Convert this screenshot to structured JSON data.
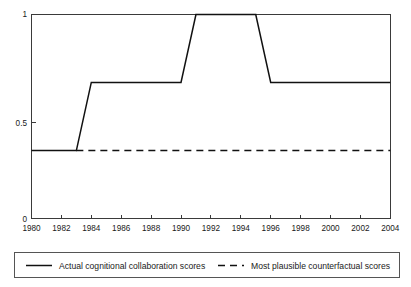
{
  "chart_data": {
    "type": "line",
    "title": "",
    "subtitle": "",
    "xlabel": "",
    "ylabel": "",
    "xlim": [
      1980,
      2004
    ],
    "ylim": [
      0,
      1
    ],
    "grid": false,
    "legend_position": "bottom",
    "x_ticks": [
      1980,
      1982,
      1984,
      1986,
      1988,
      1990,
      1992,
      1994,
      1996,
      1998,
      2000,
      2002,
      2004
    ],
    "x_tick_labels": [
      "1980",
      "1982",
      "1984",
      "1986",
      "1988",
      "1990",
      "1992",
      "1994",
      "1996",
      "1998",
      "2000",
      "2002",
      "2004"
    ],
    "y_ticks": [
      0,
      0.5,
      1
    ],
    "y_tick_labels": [
      "0",
      "0.5",
      "1"
    ],
    "series": [
      {
        "name": "Actual cognitional collaboration scores",
        "style": "solid",
        "color": "#111111",
        "x": [
          1980,
          1983,
          1984,
          1990,
          1991,
          1995,
          1996,
          2004
        ],
        "values": [
          0.333,
          0.333,
          0.667,
          0.667,
          1.0,
          1.0,
          0.667,
          0.667
        ]
      },
      {
        "name": "Most plausible counterfactual scores",
        "style": "dashed",
        "color": "#111111",
        "x": [
          1983,
          2004
        ],
        "values": [
          0.333,
          0.333
        ]
      }
    ],
    "legend": [
      {
        "label": "Actual cognitional collaboration scores",
        "style": "solid"
      },
      {
        "label": "Most plausible counterfactual scores",
        "style": "dashed"
      }
    ]
  },
  "axis": {
    "y_label_top": "1",
    "y_label_mid": "0.5",
    "y_label_bottom": "0",
    "x_labels": [
      "1980",
      "1982",
      "1984",
      "1986",
      "1988",
      "1990",
      "1992",
      "1994",
      "1996",
      "1998",
      "2000",
      "2002",
      "2004"
    ]
  },
  "legend": {
    "entry_1": "Actual cognitional collaboration scores",
    "entry_2": "Most plausible counterfactual scores"
  },
  "colors": {
    "series": "#111111",
    "frame": "#3a3a3a",
    "legend_border": "#555555",
    "background": "#ffffff"
  }
}
